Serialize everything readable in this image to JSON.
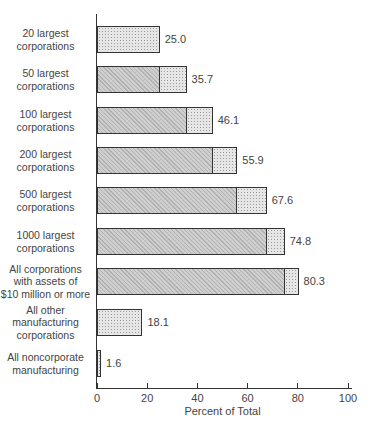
{
  "chart_data": {
    "type": "bar",
    "orientation": "horizontal",
    "title": "",
    "xlabel": "Percent of Total",
    "ylabel": "",
    "xlim": [
      0,
      100
    ],
    "xticks": [
      0,
      20,
      40,
      60,
      80,
      100
    ],
    "grid": false,
    "legend": null,
    "categories": [
      "20 largest corporations",
      "50 largest corporations",
      "100 largest corporations",
      "200 largest corporations",
      "500 largest corporations",
      "1000 largest corporations",
      "All corporations with assets of $10 million or more",
      "All other manufacturing corporations",
      "All noncorporate manufacturing"
    ],
    "values": [
      25.0,
      35.7,
      46.1,
      55.9,
      67.6,
      74.8,
      80.3,
      18.1,
      1.6
    ],
    "value_labels": [
      "25.0",
      "35.7",
      "46.1",
      "55.9",
      "67.6",
      "74.8",
      "80.3",
      "18.1",
      "1.6"
    ],
    "series": [
      {
        "name": "Cumulative share of preceding group (dark segment)",
        "values": [
          0,
          25.0,
          35.7,
          46.1,
          55.9,
          67.6,
          74.8,
          0,
          0
        ]
      },
      {
        "name": "Incremental share (light segment)",
        "values": [
          25.0,
          10.7,
          10.4,
          9.8,
          11.7,
          7.2,
          5.5,
          18.1,
          1.6
        ]
      }
    ]
  },
  "labels": [
    [
      "20 largest",
      "corporations"
    ],
    [
      "50 largest",
      "corporations"
    ],
    [
      "100 largest",
      "corporations"
    ],
    [
      "200 largest",
      "corporations"
    ],
    [
      "500 largest",
      "corporations"
    ],
    [
      "1000 largest",
      "corporations"
    ],
    [
      "All corporations",
      "with assets of",
      "$10 million or more"
    ],
    [
      "All other",
      "manufacturing",
      "corporations"
    ],
    [
      "All noncorporate",
      "manufacturing"
    ]
  ],
  "tick_labels": [
    "0",
    "20",
    "40",
    "60",
    "80",
    "100"
  ]
}
